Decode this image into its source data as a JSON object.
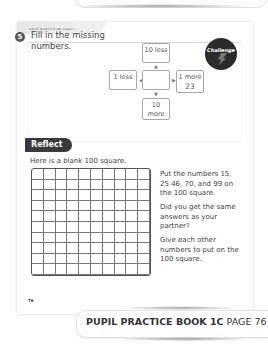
{
  "header": {
    "unit_label": "Unit 14: Numbers to 100, Lesson 2"
  },
  "question": {
    "number": "5",
    "text": "Fill in the missing numbers.",
    "badge_label": "Challenge",
    "boxes": {
      "top": "10 less",
      "left": "1 less",
      "center": "",
      "right_label": "1 more",
      "right_value": "23",
      "bottom": "10 more"
    }
  },
  "reflect": {
    "tag": "Reflect",
    "intro": "Here is a blank 100 square.",
    "grid": {
      "rows": 10,
      "columns": 10
    },
    "instructions": [
      "Put the numbers 15, 25 46, 70, and 99 on the 100 square.",
      "Did you get the same answers as your partner?",
      "Give each other numbers to put on the 100 square."
    ]
  },
  "page_number": "76",
  "footer": {
    "book": "PUPIL PRACTICE BOOK 1C",
    "page": "PAGE 76"
  }
}
